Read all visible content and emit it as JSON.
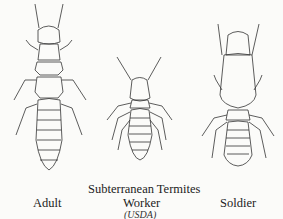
{
  "figure": {
    "title": "Subterranean Termites",
    "credit": "(USDA)",
    "castes": [
      {
        "label": "Adult"
      },
      {
        "label": "Worker"
      },
      {
        "label": "Soldier"
      }
    ]
  }
}
